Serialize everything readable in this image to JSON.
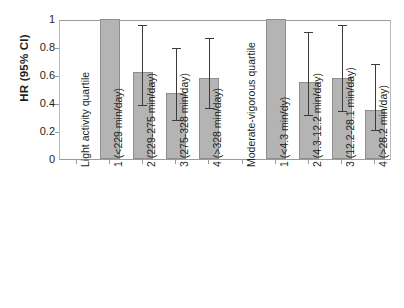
{
  "chart_data": {
    "type": "bar",
    "title": "",
    "subtitle": "",
    "xlabel": "",
    "ylabel": "HR (95% CI)",
    "ylim": [
      0,
      1
    ],
    "yticks": [
      "0",
      "0.2",
      "0.4",
      "0.6",
      "0.8",
      "1"
    ],
    "ytick_values": [
      0,
      0.2,
      0.4,
      0.6,
      0.8,
      1
    ],
    "grid": false,
    "legend": "none",
    "error_bar_type": "95% CI",
    "groups": [
      {
        "name": "Light activity quartile",
        "categories": [
          "1 (<229 min/day)",
          "2 (229-275 min/day)",
          "3 (275-328 min/day)",
          "4 (>328 min/day)"
        ],
        "values": [
          1.0,
          0.62,
          0.47,
          0.58
        ],
        "ci_lower": [
          null,
          0.4,
          0.29,
          0.38
        ],
        "ci_upper": [
          null,
          0.97,
          0.81,
          0.88
        ],
        "reference_index": 0
      },
      {
        "name": "Moderate-vigorous quartile",
        "categories": [
          "1 (<4.3 min/dy)",
          "2 (4.3-12.2 min/day)",
          "3 (12.2-28.1 min/day)",
          "4 (>28.2 min/day)"
        ],
        "values": [
          1.0,
          0.55,
          0.58,
          0.35
        ],
        "ci_lower": [
          null,
          0.33,
          0.36,
          0.22
        ],
        "ci_upper": [
          null,
          0.92,
          0.97,
          0.69
        ],
        "reference_index": 0
      }
    ],
    "axis_labels_order": [
      "Light activity quartile",
      "1 (<229 min/day)",
      "2 (229-275 min/day)",
      "3 (275-328 min/day)",
      "4 (>328 min/day)",
      "Moderate-vigorous quartile",
      "1 (<4.3 min/dy)",
      "2 (4.3-12.2 min/day)",
      "3 (12.2-28.1 min/day)",
      "4 (>28.2 min/day)"
    ],
    "colors": {
      "bar_fill": "#b4b4b4",
      "bar_border": "#8e8e8e",
      "error_bar": "#3b3b3b",
      "axis": "#9c9c9c",
      "text": "#231f20",
      "background": "#ffffff"
    }
  }
}
